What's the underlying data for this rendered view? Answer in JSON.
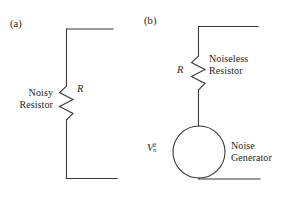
{
  "figure": {
    "type": "circuit-diagram",
    "line_color": "#3a3a3a",
    "text_color": "#242424",
    "background": "#ffffff"
  },
  "panels": [
    {
      "tag": "(a)",
      "caption": "Noisy\nResistor",
      "symbol": "R",
      "elements": [
        "wire-top",
        "resistor-zigzag",
        "wire-bottom"
      ]
    },
    {
      "tag": "(b)",
      "caption_resistor": "Noiseless\nResistor",
      "caption_generator": "Noise\nGenerator",
      "symbol": "R",
      "generator_label": {
        "base": "V",
        "sub": "n",
        "sup": "2"
      },
      "elements": [
        "wire-top",
        "resistor-zigzag",
        "noise-generator-circle",
        "wire-bottom"
      ]
    }
  ]
}
